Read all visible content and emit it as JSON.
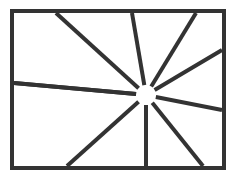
{
  "canvas": {
    "width": 238,
    "height": 179,
    "background_color": "#ffffff"
  },
  "figure": {
    "name": "radiating-lines-in-rectangle",
    "stroke_color": "#333333",
    "frame": {
      "x": 12,
      "y": 11,
      "width": 212,
      "height": 157,
      "stroke_width": 4,
      "fill": "#ffffff"
    },
    "hub": {
      "center_x": 146,
      "center_y": 95,
      "gap_radius": 10,
      "fill": "#ffffff"
    },
    "ray_stroke_width": 4,
    "ray_count": 10,
    "rays": [
      {
        "name": "ray-top-left",
        "end_x": 56,
        "end_y": 13
      },
      {
        "name": "ray-top-center",
        "end_x": 132,
        "end_y": 13
      },
      {
        "name": "ray-top-right",
        "end_x": 196,
        "end_y": 13
      },
      {
        "name": "ray-right-upper",
        "end_x": 222,
        "end_y": 50
      },
      {
        "name": "ray-right-lower",
        "end_x": 222,
        "end_y": 110
      },
      {
        "name": "ray-bottom-right",
        "end_x": 203,
        "end_y": 166
      },
      {
        "name": "ray-bottom-center",
        "end_x": 146,
        "end_y": 166
      },
      {
        "name": "ray-bottom-left",
        "end_x": 67,
        "end_y": 166
      },
      {
        "name": "ray-left-lower",
        "end_x": 14,
        "end_y": 83
      },
      {
        "name": "ray-left-upper",
        "end_x": 14,
        "end_y": 83
      }
    ]
  }
}
